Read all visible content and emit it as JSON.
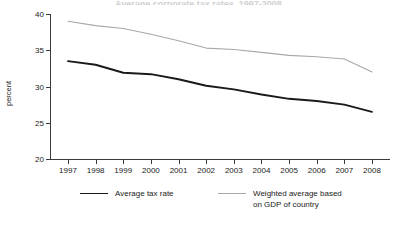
{
  "figure": {
    "title_cropped": "Average corporate tax rates, 1997-2008",
    "ylabel": "percent"
  },
  "chart_data": {
    "type": "line",
    "title": "",
    "xlabel": "",
    "ylabel": "percent",
    "x": [
      1997,
      1998,
      1999,
      2000,
      2001,
      2002,
      2003,
      2004,
      2005,
      2006,
      2007,
      2008
    ],
    "categories": [
      "1997",
      "1998",
      "1999",
      "2000",
      "2001",
      "2002",
      "2003",
      "2004",
      "2005",
      "2006",
      "2007",
      "2008"
    ],
    "xlim": [
      1997,
      2008
    ],
    "ylim": [
      20,
      40
    ],
    "yticks": [
      20,
      25,
      30,
      35,
      40
    ],
    "ytick_labels": [
      "20",
      "25",
      "30",
      "35",
      "40"
    ],
    "grid": false,
    "legend_position": "bottom",
    "series": [
      {
        "name": "Average tax rate",
        "color": "#1a1a1a",
        "width": 1.9,
        "values": [
          33.5,
          33.0,
          31.9,
          31.7,
          31.0,
          30.1,
          29.6,
          28.9,
          28.3,
          28.0,
          27.5,
          26.5
        ]
      },
      {
        "name": "Weighted average based\non GDP of country",
        "color": "#a8a8a8",
        "width": 1.1,
        "values": [
          39.0,
          38.4,
          38.0,
          37.2,
          36.3,
          35.3,
          35.1,
          34.7,
          34.3,
          34.1,
          33.8,
          32.0
        ]
      }
    ]
  },
  "legend": {
    "items": [
      {
        "label": "Average tax rate",
        "color": "#1a1a1a"
      },
      {
        "label": "Weighted average based\non GDP of country",
        "color": "#a8a8a8"
      }
    ]
  }
}
